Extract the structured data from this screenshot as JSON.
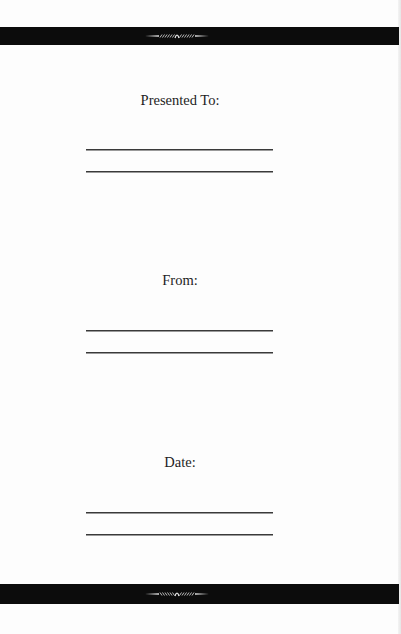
{
  "document": {
    "type": "presentation-page",
    "sections": [
      {
        "label": "Presented To:",
        "lines": 2
      },
      {
        "label": "From:",
        "lines": 2
      },
      {
        "label": "Date:",
        "lines": 2
      }
    ]
  },
  "decorations": {
    "top_bar": {
      "icon": "ornament-flourish-icon",
      "color": "#0c0c0c"
    },
    "bottom_bar": {
      "icon": "ornament-flourish-icon",
      "color": "#0c0c0c"
    }
  },
  "colors": {
    "background": "#fdfdfd",
    "bar": "#0c0c0c",
    "text": "#1e1e1e",
    "rule": "#3a3a3a"
  }
}
